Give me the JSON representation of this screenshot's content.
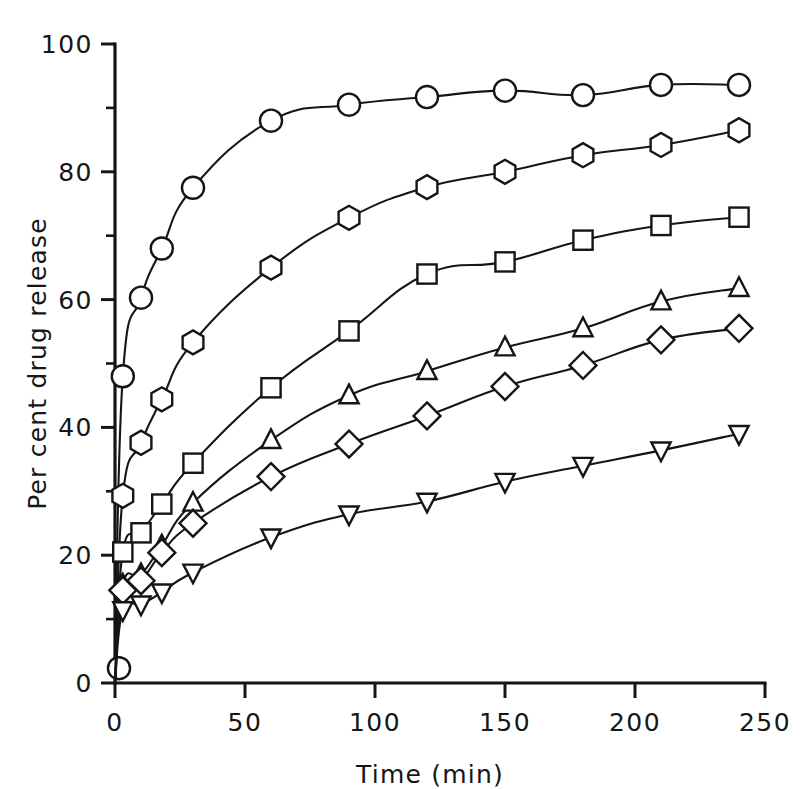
{
  "chart_data": {
    "type": "line",
    "title": "",
    "xlabel": "Time (min)",
    "ylabel": "Per cent drug release",
    "xlim": [
      0,
      250
    ],
    "ylim": [
      0,
      100
    ],
    "xticks": [
      0,
      50,
      100,
      150,
      200,
      250
    ],
    "yticks": [
      0,
      20,
      40,
      60,
      80,
      100
    ],
    "xtick_labels": [
      "0",
      "50",
      "100",
      "150",
      "200",
      "250"
    ],
    "ytick_labels": [
      "0",
      "20",
      "40",
      "60",
      "80",
      "100"
    ],
    "x_minor_ticks": [
      25,
      75,
      125,
      175,
      225
    ],
    "y_minor_ticks": [
      10,
      30,
      50,
      70,
      90
    ],
    "grid": false,
    "legend": "none",
    "series": [
      {
        "name": "circle",
        "marker": "circle",
        "x": [
          0,
          3,
          10,
          18,
          30,
          60,
          90,
          120,
          150,
          180,
          210,
          240
        ],
        "y": [
          2.0,
          48.0,
          60.3,
          68.0,
          77.5,
          88.0,
          90.5,
          91.7,
          92.7,
          92.0,
          93.6,
          93.6
        ]
      },
      {
        "name": "hexagon",
        "marker": "hexagon",
        "x": [
          0,
          3,
          10,
          18,
          30,
          60,
          90,
          120,
          150,
          180,
          210,
          240
        ],
        "y": [
          0.0,
          29.3,
          37.6,
          44.4,
          53.3,
          65.0,
          72.8,
          77.6,
          80.0,
          82.6,
          84.2,
          86.5
        ]
      },
      {
        "name": "square",
        "marker": "square",
        "x": [
          0,
          3,
          10,
          18,
          30,
          60,
          90,
          120,
          150,
          180,
          210,
          240
        ],
        "y": [
          0.0,
          20.5,
          23.5,
          28.0,
          34.4,
          46.2,
          55.1,
          64.0,
          65.9,
          69.3,
          71.6,
          72.9
        ]
      },
      {
        "name": "triangle-up",
        "marker": "triangle-up",
        "x": [
          0,
          3,
          10,
          18,
          30,
          60,
          90,
          120,
          150,
          180,
          210,
          240
        ],
        "y": [
          0.0,
          15.4,
          17.0,
          21.5,
          28.2,
          38.0,
          45.0,
          48.8,
          52.5,
          55.5,
          59.7,
          61.8
        ]
      },
      {
        "name": "diamond",
        "marker": "diamond",
        "x": [
          0,
          3,
          10,
          18,
          30,
          60,
          90,
          120,
          150,
          180,
          210,
          240
        ],
        "y": [
          0.0,
          14.5,
          16.0,
          20.4,
          25.0,
          32.3,
          37.4,
          41.8,
          46.4,
          49.7,
          53.7,
          55.5
        ]
      },
      {
        "name": "triangle-down",
        "marker": "triangle-down",
        "x": [
          0,
          3,
          10,
          18,
          30,
          60,
          90,
          120,
          150,
          180,
          210,
          240
        ],
        "y": [
          0.0,
          11.4,
          12.3,
          14.2,
          17.3,
          22.8,
          26.4,
          28.4,
          31.5,
          34.0,
          36.4,
          39.0
        ]
      }
    ]
  },
  "axes": {
    "x_title": "Time (min)",
    "y_title": "Per cent drug release"
  },
  "colors": {
    "ink": "#151515",
    "background": "#ffffff"
  }
}
